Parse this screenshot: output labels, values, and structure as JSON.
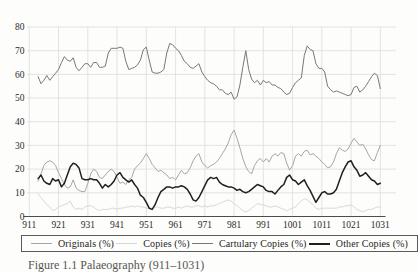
{
  "figure": {
    "caption": "Figure 1.1 Palaeography (911–1031)"
  },
  "axes": {
    "y_ticks": [
      "0",
      "10",
      "20",
      "30",
      "40",
      "50",
      "60",
      "70",
      "80"
    ],
    "x_ticks": [
      "911",
      "921",
      "931",
      "941",
      "951",
      "961",
      "971",
      "981",
      "991",
      "1001",
      "1011",
      "1021",
      "1031"
    ]
  },
  "colors": {
    "background": "#fdfdfb",
    "grid": "#dcdcdc",
    "axis": "#4d4d4d",
    "tick_text": "#2b2b2b",
    "legend_border": "#5a5a5a"
  },
  "chart_data": {
    "type": "line",
    "title": "",
    "xlabel": "",
    "ylabel": "",
    "xlim": [
      911,
      1031
    ],
    "ylim": [
      0,
      80
    ],
    "x_tick_values": [
      911,
      921,
      931,
      941,
      951,
      961,
      971,
      981,
      991,
      1001,
      1011,
      1021,
      1031
    ],
    "y_tick_values": [
      0,
      10,
      20,
      30,
      40,
      50,
      60,
      70,
      80
    ],
    "grid": true,
    "legend_position": "bottom",
    "x_start_year": 914,
    "x_step": 1,
    "series": [
      {
        "name": "Originals (%)",
        "color": "#a6a6a6",
        "width": 1,
        "values": [
          15,
          18,
          21.5,
          23,
          23.5,
          23,
          21.5,
          18.5,
          16,
          13.5,
          12,
          12.5,
          15.5,
          12,
          11,
          10.5,
          10.5,
          14,
          18,
          20,
          19,
          16.5,
          16,
          17.5,
          19,
          20,
          19,
          16.5,
          14,
          14.5,
          13.5,
          15.5,
          16.5,
          20,
          21.5,
          22.5,
          24.5,
          26.5,
          24.5,
          22,
          20.5,
          19,
          19.5,
          18.5,
          17.5,
          16,
          16.5,
          15.5,
          17.5,
          19.5,
          18,
          18.5,
          20.5,
          23.5,
          25.5,
          26.5,
          23,
          21.5,
          20.5,
          21.5,
          22,
          23,
          24.5,
          26.5,
          28.5,
          31,
          34.5,
          36.5,
          33,
          29,
          24.5,
          21,
          19,
          18,
          21.5,
          23.5,
          24.5,
          23,
          24.5,
          23,
          25.5,
          26.5,
          25.5,
          27,
          26.5,
          22.5,
          19.5,
          21.5,
          25.5,
          26.5,
          25.5,
          27.5,
          28,
          26,
          26.5,
          25.5,
          24.5,
          23,
          22,
          20.5,
          21,
          23,
          26.5,
          29,
          28,
          27.5,
          28.5,
          31,
          33,
          31.5,
          30,
          30.5,
          28.5,
          26,
          24,
          23.5,
          27,
          30
        ]
      },
      {
        "name": "Copies (%)",
        "color": "#d8d8d8",
        "width": 1,
        "values": [
          9.5,
          8,
          6.5,
          5,
          4,
          2.5,
          3,
          4,
          4.5,
          5,
          5.5,
          6.5,
          4,
          3,
          3.5,
          3,
          4,
          4.5,
          4.5,
          4,
          3,
          2.5,
          3,
          3,
          3,
          3.5,
          3.5,
          3,
          3.5,
          3.5,
          4,
          4,
          4.5,
          4,
          4.5,
          4,
          4,
          3.5,
          3.5,
          3.5,
          4,
          4,
          3.5,
          3.5,
          4,
          4,
          3.5,
          3.5,
          4,
          3.5,
          4,
          4.5,
          4,
          4,
          4.5,
          4.5,
          4,
          4.5,
          4,
          4.5,
          4.5,
          5,
          5.5,
          6,
          6.5,
          7,
          6.5,
          5.5,
          4.5,
          3.5,
          2.5,
          2,
          2.5,
          3.5,
          4.5,
          5.5,
          5,
          5,
          4.5,
          4,
          4,
          4.5,
          4,
          3.5,
          3,
          2.5,
          3,
          3.5,
          4,
          5.5,
          6.5,
          7.5,
          7,
          6,
          5,
          3.5,
          3,
          3.5,
          3.5,
          3.5,
          3.5,
          3.5,
          3.5,
          4,
          4,
          4.5,
          4.5,
          5,
          4,
          3,
          2.5,
          2,
          2.5,
          3,
          3,
          3.5,
          4,
          4
        ]
      },
      {
        "name": "Cartulary Copies (%)",
        "color": "#787878",
        "width": 1,
        "values": [
          59,
          56,
          57.5,
          59.5,
          57.5,
          59,
          60.5,
          62,
          65,
          67.5,
          66,
          65.5,
          67,
          63,
          61.5,
          63,
          64.5,
          64.5,
          63,
          65,
          65,
          63,
          63,
          63.5,
          69,
          71,
          71,
          71,
          71.5,
          71,
          65.5,
          62,
          62.5,
          63,
          64,
          66,
          70.5,
          71.5,
          66,
          61,
          60.5,
          60.5,
          61,
          62,
          69,
          73,
          72.5,
          71,
          70,
          68,
          65.5,
          64.5,
          63,
          62.5,
          63.5,
          64.5,
          61,
          59,
          57.5,
          56.5,
          56,
          55,
          53.5,
          53.5,
          52,
          51.5,
          52.5,
          49.5,
          50.5,
          55.5,
          63,
          70,
          62,
          58,
          56.5,
          57.5,
          55.5,
          57.5,
          56.5,
          57,
          55.5,
          55.5,
          54.5,
          54,
          52.5,
          51.5,
          52,
          54.5,
          56.5,
          57.5,
          58.5,
          68,
          72,
          70.5,
          70,
          64.5,
          62.5,
          62.5,
          61,
          55,
          53.5,
          52.5,
          53,
          52.5,
          52,
          51.5,
          51,
          51.5,
          54.5,
          55,
          52.5,
          53.5,
          55,
          57,
          59,
          60.5,
          59.5,
          54
        ]
      },
      {
        "name": "Other Copies (%)",
        "color": "#1f1f1f",
        "width": 1.5,
        "values": [
          16,
          17.5,
          15,
          14,
          13.5,
          16,
          15,
          15.5,
          12.5,
          14,
          17.5,
          21,
          22.5,
          22,
          20.5,
          16,
          15.5,
          15.5,
          16,
          15.5,
          15.5,
          14,
          12,
          13.5,
          12.5,
          13.5,
          15,
          17.5,
          18.5,
          16.5,
          15.5,
          14.5,
          15.5,
          13.5,
          12,
          9,
          8,
          6,
          3.5,
          3,
          5,
          8,
          10.5,
          11.5,
          12.5,
          12.5,
          12,
          12.5,
          12.5,
          13,
          12.5,
          11.5,
          9.5,
          7,
          6.5,
          8,
          10.5,
          13,
          15.5,
          16.5,
          16,
          16.5,
          14.5,
          13.5,
          13,
          12.5,
          12.5,
          12,
          11,
          11.5,
          10.5,
          10,
          10.5,
          11.5,
          12.5,
          13.5,
          13,
          12.5,
          11,
          10.5,
          10.5,
          9.5,
          11,
          12.5,
          13.5,
          16.5,
          17.5,
          15.5,
          15,
          13.5,
          14.5,
          15.5,
          13,
          11,
          8.5,
          6,
          8,
          10,
          10.5,
          9.5,
          9.5,
          10,
          11.5,
          15,
          18.5,
          21,
          23,
          23.5,
          21,
          19.5,
          17,
          17.5,
          18.5,
          17,
          15.5,
          15,
          13.5,
          14
        ]
      }
    ]
  }
}
